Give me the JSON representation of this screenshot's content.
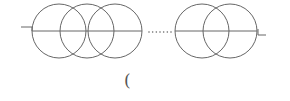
{
  "diagram": {
    "stroke_color": "#666666",
    "axis_y": 31,
    "radius": 27,
    "left_group_centers": [
      59,
      87,
      115
    ],
    "right_group_centers": [
      202,
      230
    ],
    "line_segments": [
      [
        32,
        142
      ],
      [
        175,
        257
      ]
    ],
    "dots": {
      "x_start": 149,
      "x_end": 171,
      "count": 7
    },
    "left_end_mark": "¬",
    "right_end_mark": "L",
    "caption": "("
  }
}
